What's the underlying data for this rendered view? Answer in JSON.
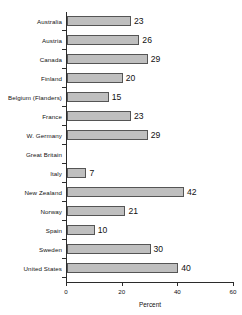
{
  "chart_data": {
    "type": "bar",
    "orientation": "horizontal",
    "title": "",
    "xlabel": "Percent",
    "ylabel": "",
    "xlim": [
      0,
      60
    ],
    "xticks": [
      0,
      20,
      40,
      60
    ],
    "grid": false,
    "legend": null,
    "bar_color": "#bfbfbf",
    "bar_edge_color": "#555555",
    "axis_color": "#2b2b2b",
    "categories": [
      "Australia",
      "Austria",
      "Canada",
      "Finland",
      "Belgium (Flanders)",
      "France",
      "W. Germany",
      "Great Britain",
      "Italy",
      "New Zealand",
      "Norway",
      "Spain",
      "Sweden",
      "United States"
    ],
    "values": [
      23,
      26,
      29,
      20,
      15,
      23,
      29,
      null,
      7,
      42,
      21,
      10,
      30,
      40
    ],
    "value_labels": [
      "23",
      "26",
      "29",
      "20",
      "15",
      "23",
      "29",
      "",
      "7",
      "42",
      "21",
      "10",
      "30",
      "40"
    ]
  }
}
